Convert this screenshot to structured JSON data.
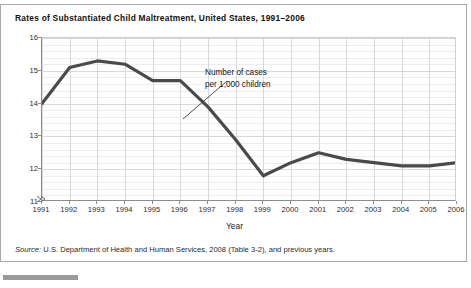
{
  "figure": {
    "title": "Rates of Substantiated Child Maltreatment, United States, 1991–2006",
    "source_label": "Source:",
    "source_text": " U.S. Department of Health and Human Services, 2008 (Table 3-2), and previous years."
  },
  "chart_data": {
    "type": "line",
    "title": "Rates of Substantiated Child Maltreatment, United States, 1991–2006",
    "xlabel": "Year",
    "ylabel": "",
    "annotation": {
      "line1": "Number of cases",
      "line2": "per 1,000 children",
      "points_to_year": "1997"
    },
    "categories": [
      "1991",
      "1992",
      "1993",
      "1994",
      "1995",
      "1996",
      "1997",
      "1998",
      "1999",
      "2000",
      "2001",
      "2002",
      "2003",
      "2004",
      "2005",
      "2006"
    ],
    "x": [
      1991,
      1992,
      1993,
      1994,
      1995,
      1996,
      1997,
      1998,
      1999,
      2000,
      2001,
      2002,
      2003,
      2004,
      2005,
      2006
    ],
    "values": [
      14.0,
      15.1,
      15.3,
      15.2,
      14.7,
      14.7,
      13.9,
      12.9,
      11.8,
      12.2,
      12.5,
      12.3,
      12.2,
      12.1,
      12.1,
      12.2
    ],
    "series": [
      {
        "name": "Number of cases per 1,000 children",
        "values": [
          14.0,
          15.1,
          15.3,
          15.2,
          14.7,
          14.7,
          13.9,
          12.9,
          11.8,
          12.2,
          12.5,
          12.3,
          12.2,
          12.1,
          12.1,
          12.2
        ],
        "color": "#4a4a4a"
      }
    ],
    "ylim": [
      11,
      16
    ],
    "yticks": [
      11,
      12,
      13,
      14,
      15,
      16
    ],
    "ytick_labels": [
      "11",
      "12",
      "13",
      "14",
      "15",
      "16"
    ],
    "xlim": [
      1991,
      2006
    ],
    "grid": true,
    "minor_grid_step": 0.2,
    "y_axis_break": true,
    "legend": "none",
    "line_color": "#4a4a4a",
    "grid_color": "#d9d9d9",
    "axis_color": "#8d8d8d"
  }
}
